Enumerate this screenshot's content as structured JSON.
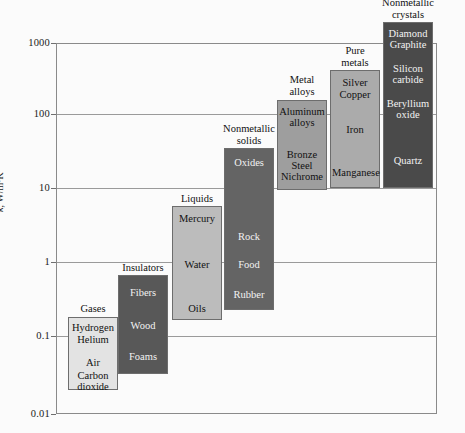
{
  "chart_data": {
    "type": "bar",
    "title": "",
    "subtitle": "",
    "xlabel": "",
    "ylabel": "k, W/m·K",
    "scale": "log",
    "ylim": [
      0.01,
      1000
    ],
    "ytick_labels": [
      "1000",
      "100",
      "10",
      "1",
      "0.1",
      "0.01"
    ],
    "ytick_values": [
      1000,
      100,
      10,
      1,
      0.1,
      0.01
    ],
    "grid": true,
    "legend": "none",
    "categories": [
      "Gases",
      "Insulators",
      "Liquids",
      "Nonmetallic solids",
      "Metal alloys",
      "Pure metals",
      "Nonmetallic crystals"
    ],
    "series": [
      {
        "name": "Gases",
        "label": "Gases",
        "range_low": 0.0075,
        "range_high": 0.17,
        "color": "#e3e3e3",
        "text_color": "dark",
        "members": [
          "Hydrogen",
          "Helium",
          "Air",
          "Carbon dioxide"
        ]
      },
      {
        "name": "Insulators",
        "label": "Insulators",
        "range_low": 0.022,
        "range_high": 0.62,
        "color": "#585858",
        "text_color": "light",
        "members": [
          "Fibers",
          "Wood",
          "Foams"
        ]
      },
      {
        "name": "Liquids",
        "label": "Liquids",
        "range_low": 0.09,
        "range_high": 6.2,
        "color": "#bcbcbc",
        "text_color": "dark",
        "members": [
          "Mercury",
          "Water",
          "Oils"
        ]
      },
      {
        "name": "Nonmetallic solids",
        "label": "Nonmetallic solids",
        "range_low": 0.18,
        "range_high": 36.0,
        "color": "#646464",
        "text_color": "light",
        "members": [
          "Oxides",
          "Rock",
          "Food",
          "Rubber"
        ]
      },
      {
        "name": "Metal alloys",
        "label": "Metal alloys",
        "range_low": 10.5,
        "range_high": 190.0,
        "color": "#9e9e9e",
        "text_color": "dark",
        "members": [
          "Aluminum alloys",
          "Bronze",
          "Steel",
          "Nichrome"
        ]
      },
      {
        "name": "Pure metals",
        "label": "Pure metals",
        "range_low": 11.0,
        "range_high": 430.0,
        "color": "#ababab",
        "text_color": "dark",
        "members": [
          "Silver",
          "Copper",
          "Iron",
          "Manganese"
        ]
      },
      {
        "name": "Nonmetallic crystals",
        "label": "Nonmetallic crystals",
        "range_low": 11.0,
        "range_high": 2100.0,
        "color": "#4a4a4a",
        "text_color": "light",
        "members": [
          "Diamond",
          "Graphite",
          "Silicon carbide",
          "Beryllium oxide",
          "Quartz"
        ]
      }
    ]
  },
  "axis": {
    "y_title_symbol": "k",
    "y_title_rest": ", W/m·K"
  },
  "bands": [
    {
      "id": "gases",
      "caption": "Gases",
      "caption_lines": [
        "Gases"
      ],
      "color": "#e3e3e3",
      "text_class": "dark-text",
      "x": 68,
      "y": 317,
      "w": 50,
      "h": 73,
      "caption_y": 303,
      "items": [
        {
          "text": "Hydrogen",
          "y": 4
        },
        {
          "text": "Helium",
          "y": 16
        },
        {
          "text": "Air",
          "y": 39
        },
        {
          "text": "Carbon",
          "y": 52
        },
        {
          "text": "dioxide",
          "y": 63
        }
      ]
    },
    {
      "id": "insulators",
      "caption": "Insulators",
      "caption_lines": [
        "Insulators"
      ],
      "color": "#585858",
      "text_class": "light-text",
      "x": 118,
      "y": 275,
      "w": 50,
      "h": 99,
      "caption_y": 262,
      "items": [
        {
          "text": "Fibers",
          "y": 11
        },
        {
          "text": "Wood",
          "y": 44
        },
        {
          "text": "Foams",
          "y": 75
        }
      ]
    },
    {
      "id": "liquids",
      "caption": "Liquids",
      "caption_lines": [
        "Liquids"
      ],
      "color": "#bcbcbc",
      "text_class": "dark-text",
      "x": 172,
      "y": 206,
      "w": 50,
      "h": 114,
      "caption_y": 193,
      "items": [
        {
          "text": "Mercury",
          "y": 6
        },
        {
          "text": "Water",
          "y": 52
        },
        {
          "text": "Oils",
          "y": 96
        }
      ]
    },
    {
      "id": "nonmetallic-solids",
      "caption": "Nonmetallic solids",
      "caption_lines": [
        "Nonmetallic",
        "solids"
      ],
      "color": "#646464",
      "text_class": "light-text",
      "x": 224,
      "y": 148,
      "w": 50,
      "h": 162,
      "caption_y": 123,
      "items": [
        {
          "text": "Oxides",
          "y": 8
        },
        {
          "text": "Rock",
          "y": 82
        },
        {
          "text": "Food",
          "y": 110
        },
        {
          "text": "Rubber",
          "y": 140
        }
      ]
    },
    {
      "id": "metal-alloys",
      "caption": "Metal alloys",
      "caption_lines": [
        "Metal",
        "alloys"
      ],
      "color": "#9e9e9e",
      "text_class": "dark-text",
      "x": 277,
      "y": 100,
      "w": 50,
      "h": 90,
      "caption_y": 74,
      "items": [
        {
          "text": "Aluminum",
          "y": 5
        },
        {
          "text": "alloys",
          "y": 16
        },
        {
          "text": "Bronze",
          "y": 48
        },
        {
          "text": "Steel",
          "y": 59
        },
        {
          "text": "Nichrome",
          "y": 70
        }
      ]
    },
    {
      "id": "pure-metals",
      "caption": "Pure metals",
      "caption_lines": [
        "Pure",
        "metals"
      ],
      "color": "#ababab",
      "text_class": "dark-text",
      "x": 330,
      "y": 70,
      "w": 50,
      "h": 118,
      "caption_y": 45,
      "items": [
        {
          "text": "Silver",
          "y": 6
        },
        {
          "text": "Copper",
          "y": 18
        },
        {
          "text": "Iron",
          "y": 53
        },
        {
          "text": "Manganese",
          "y": 96
        }
      ]
    },
    {
      "id": "nonmetallic-crystals",
      "caption": "Nonmetallic crystals",
      "caption_lines": [
        "Nonmetallic",
        "crystals"
      ],
      "color": "#4a4a4a",
      "text_class": "light-text",
      "x": 383,
      "y": 22,
      "w": 50,
      "h": 166,
      "caption_y": -3,
      "items": [
        {
          "text": "Diamond",
          "y": 5
        },
        {
          "text": "Graphite",
          "y": 16
        },
        {
          "text": "Silicon",
          "y": 40
        },
        {
          "text": "carbide",
          "y": 51
        },
        {
          "text": "Beryllium",
          "y": 75
        },
        {
          "text": "oxide",
          "y": 86
        },
        {
          "text": "Quartz",
          "y": 132
        }
      ]
    }
  ],
  "gridlines": [
    {
      "label": "1000",
      "y": 43
    },
    {
      "label": "100",
      "y": 114
    },
    {
      "label": "10",
      "y": 188
    },
    {
      "label": "1",
      "y": 262
    },
    {
      "label": "0.1",
      "y": 336
    },
    {
      "label": "0.01",
      "y": 414
    }
  ]
}
